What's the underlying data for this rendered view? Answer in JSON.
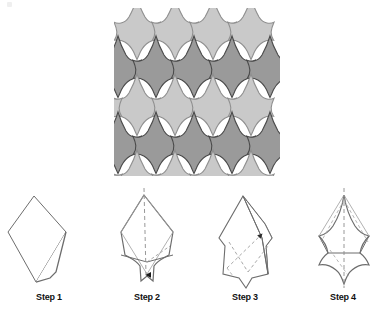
{
  "figure": {
    "kind": "origami-tessellation-instructions",
    "background_color": "#ffffff",
    "width": 392,
    "height": 317
  },
  "tessellation": {
    "name": "fleur-de-lis-tessellation",
    "tile_shape": "fleur-de-lis",
    "columns": 4,
    "rows": 5,
    "cell_width": 38,
    "cell_height": 38,
    "origin_x": 118,
    "origin_y": 12,
    "light_fill": "#c9c9c9",
    "dark_fill": "#9a9a9a",
    "light_stroke": "#8f8f8f",
    "dark_stroke": "#4a4a4a",
    "row_shades": [
      "light",
      "dark",
      "light",
      "dark",
      "light"
    ]
  },
  "steps": [
    {
      "id": "step-1",
      "label": "Step 1",
      "caption_x": 49,
      "center_x": 49,
      "description": "Kite base with small flap folded at lower right",
      "has_center_crease": false,
      "has_arrow": false
    },
    {
      "id": "step-2",
      "label": "Step 2",
      "caption_x": 147,
      "center_x": 147,
      "description": "Bottom edges folded inward forming concave notches; vertical valley crease",
      "has_center_crease": true,
      "has_arrow": true,
      "arrow_direction": "down"
    },
    {
      "id": "step-3",
      "label": "Step 3",
      "caption_x": 245,
      "center_x": 245,
      "description": "Diagonal folds on both sides; arrow indicates fold direction",
      "has_center_crease": false,
      "has_arrow": true,
      "arrow_direction": "up-right"
    },
    {
      "id": "step-4",
      "label": "Step 4",
      "caption_x": 343,
      "center_x": 343,
      "description": "Completed fleur-de-lis tile with side points spread out",
      "has_center_crease": true,
      "has_arrow": false
    }
  ],
  "styles": {
    "diagram_stroke": "#6d6d6d",
    "diagram_fold_stroke": "#9d9d9d",
    "diagram_fill": "#ffffff",
    "label_color": "#111111",
    "arrow_color": "#1a1a1a"
  }
}
